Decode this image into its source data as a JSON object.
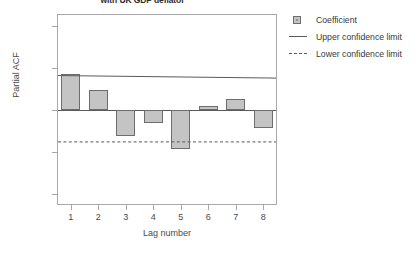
{
  "chart_data": {
    "type": "bar",
    "title": "with UK GDP deflator",
    "xlabel": "Lag number",
    "ylabel": "Partial ACF",
    "categories": [
      "1",
      "2",
      "3",
      "4",
      "5",
      "6",
      "7",
      "8"
    ],
    "values": [
      0.43,
      0.24,
      -0.31,
      -0.16,
      -0.47,
      0.05,
      0.13,
      -0.21
    ],
    "series": [
      {
        "name": "Coefficient",
        "values": [
          0.43,
          0.24,
          -0.31,
          -0.16,
          -0.47,
          0.05,
          0.13,
          -0.21
        ]
      },
      {
        "name": "Upper confidence limit",
        "values": [
          0.41,
          0.41,
          0.4,
          0.4,
          0.39,
          0.39,
          0.38,
          0.38
        ]
      },
      {
        "name": "Lower confidence limit",
        "values": [
          -0.38,
          -0.38,
          -0.38,
          -0.38,
          -0.38,
          -0.38,
          -0.38,
          -0.38
        ]
      }
    ],
    "ylim": [
      -1.25,
      1.25
    ],
    "yticks": [
      "1.0",
      "0.5",
      "0.0",
      "-0.5",
      "-1.0"
    ],
    "ytick_values": [
      1.0,
      0.5,
      0.0,
      -0.5,
      -1.0
    ],
    "xlim": [
      0.5,
      8.5
    ],
    "grid": false,
    "legend_position": "right",
    "bar_color": "#c4c4c4",
    "bar_edge_color": "#6d6d6d",
    "line_color": "#5a5a5a",
    "zero_line": 0.0
  },
  "legend": {
    "items": [
      {
        "label": "Coefficient",
        "key": "swatch-icon"
      },
      {
        "label": "Upper confidence limit",
        "key": "solid-line-icon"
      },
      {
        "label": "Lower confidence limit",
        "key": "dashed-line-icon"
      }
    ]
  }
}
